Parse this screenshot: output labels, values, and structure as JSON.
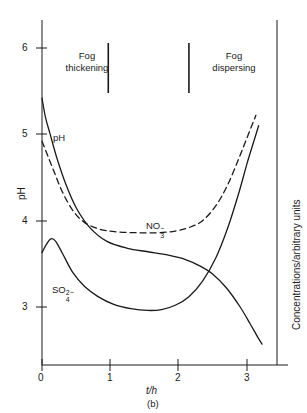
{
  "figure": {
    "caption": "(b)",
    "x_axis_title": "t/h",
    "y_axis_title_left": "pH",
    "y_axis_title_right": "Concentrations/arbitrary units"
  },
  "annotations": {
    "region_left_line1": "Fog",
    "region_left_line2": "thickening",
    "region_right_line1": "Fog",
    "region_right_line2": "dispersing",
    "series_ph": "pH",
    "series_no3_base": "NO",
    "series_no3_sub": "3",
    "series_no3_sup": "−",
    "series_so4_base": "SO",
    "series_so4_sub": "4",
    "series_so4_sup": "2−"
  },
  "chart_data": {
    "type": "line",
    "title": "",
    "subtitle": "",
    "xlabel": "t/h",
    "ylabel": "pH",
    "ylabel_right": "Concentrations/arbitrary units",
    "xlim": [
      0,
      3.45
    ],
    "ylim": [
      2.45,
      6.35
    ],
    "xticks": [
      0,
      1,
      2,
      3
    ],
    "xtick_labels": [
      "0",
      "1",
      "2",
      "3"
    ],
    "yticks": [
      3,
      4,
      5,
      6
    ],
    "ytick_labels": [
      "3",
      "4",
      "5",
      "6"
    ],
    "grid": false,
    "legend": "inline-labels",
    "region_dividers_x": [
      0.97,
      2.15
    ],
    "regions": [
      {
        "label": "Fog thickening",
        "x_center": 0.47
      },
      {
        "label": "Fog dispersing",
        "x_center": 2.77
      }
    ],
    "series": [
      {
        "name": "pH",
        "style": "solid",
        "color": "#1a1a1a",
        "x": [
          0.0,
          0.05,
          0.12,
          0.22,
          0.35,
          0.5,
          0.7,
          0.95,
          1.25,
          1.55,
          1.85,
          2.1,
          2.3,
          2.5,
          2.7,
          2.9,
          3.05,
          3.15,
          3.22
        ],
        "y": [
          5.42,
          5.2,
          5.0,
          4.72,
          4.42,
          4.15,
          3.92,
          3.76,
          3.68,
          3.64,
          3.6,
          3.55,
          3.48,
          3.38,
          3.22,
          3.0,
          2.8,
          2.66,
          2.57
        ]
      },
      {
        "name": "NO3-",
        "style": "dashed",
        "color": "#1a1a1a",
        "x": [
          0.0,
          0.08,
          0.18,
          0.3,
          0.45,
          0.62,
          0.85,
          1.1,
          1.4,
          1.7,
          1.95,
          2.15,
          2.35,
          2.55,
          2.72,
          2.88,
          3.0,
          3.08,
          3.13
        ],
        "y": [
          4.92,
          4.76,
          4.56,
          4.33,
          4.12,
          3.98,
          3.9,
          3.87,
          3.86,
          3.86,
          3.88,
          3.92,
          4.0,
          4.18,
          4.42,
          4.72,
          4.96,
          5.12,
          5.22
        ]
      },
      {
        "name": "SO42-",
        "style": "solid",
        "color": "#1a1a1a",
        "x": [
          0.0,
          0.06,
          0.13,
          0.2,
          0.3,
          0.45,
          0.62,
          0.82,
          1.05,
          1.3,
          1.55,
          1.75,
          1.95,
          2.15,
          2.35,
          2.55,
          2.72,
          2.88,
          3.0,
          3.1,
          3.17
        ],
        "y": [
          3.63,
          3.72,
          3.79,
          3.76,
          3.62,
          3.4,
          3.24,
          3.12,
          3.03,
          2.98,
          2.96,
          2.97,
          3.02,
          3.12,
          3.3,
          3.58,
          3.92,
          4.32,
          4.66,
          4.92,
          5.1
        ]
      }
    ]
  }
}
